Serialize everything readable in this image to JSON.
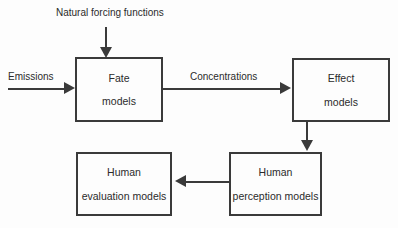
{
  "diagram": {
    "background_color": "#fdfdfd",
    "stroke_color": "#3a3a3a",
    "text_color": "#2b2b2b",
    "nodes": [
      {
        "id": "fate",
        "line1": "Fate",
        "line2": "models"
      },
      {
        "id": "effect",
        "line1": "Effect",
        "line2": "models"
      },
      {
        "id": "perception",
        "line1": "Human",
        "line2": "perception models"
      },
      {
        "id": "evaluation",
        "line1": "Human",
        "line2": "evaluation models"
      }
    ],
    "edge_labels": {
      "natural_forcing": "Natural forcing functions",
      "emissions": "Emissions",
      "concentrations": "Concentrations"
    }
  }
}
